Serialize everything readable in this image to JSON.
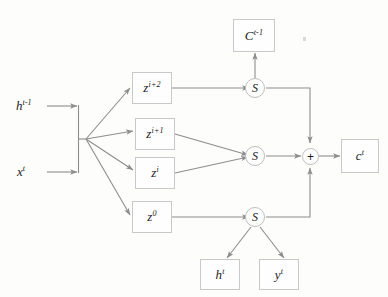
{
  "figure": {
    "kind": "block-diagram",
    "background_color": "#fdfdfc",
    "line_color": "#8d8d8d",
    "box_border_color": "#c9c9c9",
    "text_color": "#1b1b1b"
  },
  "inputs": [
    {
      "name": "hidden-state-prev",
      "base": "h",
      "sup": "t-1",
      "text": "h t-1"
    },
    {
      "name": "input-x",
      "base": "x",
      "sup": "t",
      "text": "x t"
    }
  ],
  "z_boxes": [
    {
      "name": "z-i-plus-2",
      "base": "z",
      "sup": "i+2",
      "text": "z i+2"
    },
    {
      "name": "z-i-plus-1",
      "base": "z",
      "sup": "i+1",
      "text": "z i+1"
    },
    {
      "name": "z-i",
      "base": "z",
      "sup": "i",
      "text": "z i"
    },
    {
      "name": "z-zero",
      "base": "z",
      "sup": "0",
      "text": "z 0"
    }
  ],
  "s_nodes": [
    {
      "name": "s-top",
      "label": "S"
    },
    {
      "name": "s-middle",
      "label": "S"
    },
    {
      "name": "s-bottom",
      "label": "S"
    }
  ],
  "sum_node": {
    "name": "sum",
    "label": "+"
  },
  "outputs": [
    {
      "name": "cell-state-prev",
      "base": "C",
      "sup": "t-1",
      "text": "C t-1"
    },
    {
      "name": "cell-state-out",
      "base": "c",
      "sup": "t",
      "text": "c t"
    },
    {
      "name": "hidden-state-out",
      "base": "h",
      "sup": "t",
      "text": "h t"
    },
    {
      "name": "output-y",
      "base": "y",
      "sup": "t",
      "text": "y t"
    }
  ]
}
